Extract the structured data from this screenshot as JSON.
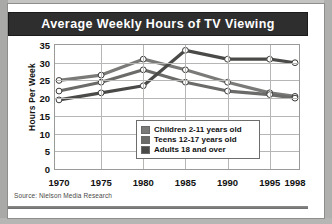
{
  "header": {
    "title": "Average Weekly Hours of TV Viewing"
  },
  "source": {
    "text": "Source: Nielson Media Research"
  },
  "colors": {
    "series_children": "#7a7a78",
    "series_teens": "#6b6b69",
    "series_adults": "#4a4a48",
    "header_bg": "#2e2e2e",
    "grid": "#b6b6b4",
    "plot_bg": "#ffffff"
  },
  "legend": {
    "position": "inside-bottom-center",
    "items": [
      {
        "label": "Children 2-11 years old",
        "swatch": "#7a7a78"
      },
      {
        "label": "Teens 12-17 years old",
        "swatch": "#6b6b69"
      },
      {
        "label": "Adults 18 and over",
        "swatch": "#4a4a48"
      }
    ]
  },
  "chart_data": {
    "type": "line",
    "title": "Average Weekly Hours of TV Viewing",
    "subtitle": "",
    "xlabel": "",
    "ylabel": "Hours Per Week",
    "x": [
      1970,
      1975,
      1980,
      1985,
      1990,
      1995,
      1998
    ],
    "xticklabels": [
      "1970",
      "1975",
      "1980",
      "1985",
      "1990",
      "1995",
      "1998"
    ],
    "yticks": [
      0,
      5,
      10,
      15,
      20,
      25,
      30,
      35
    ],
    "yticklabels": [
      "0",
      "5",
      "10",
      "15",
      "20",
      "25",
      "30",
      "35"
    ],
    "ylim": [
      0,
      35
    ],
    "xlim": [
      1970,
      1998
    ],
    "grid": true,
    "markers": "open-circle",
    "series": [
      {
        "name": "Children 2-11 years old",
        "color": "#7a7a78",
        "values": [
          25.0,
          26.5,
          31.0,
          28.0,
          24.5,
          21.5,
          20.5
        ]
      },
      {
        "name": "Teens 12-17 years old",
        "color": "#6b6b69",
        "values": [
          22.0,
          24.5,
          28.0,
          24.5,
          22.0,
          21.0,
          20.0
        ]
      },
      {
        "name": "Adults 18 and over",
        "color": "#4a4a48",
        "values": [
          19.5,
          21.5,
          23.5,
          33.5,
          31.0,
          31.0,
          30.0
        ]
      }
    ],
    "annotations": []
  }
}
